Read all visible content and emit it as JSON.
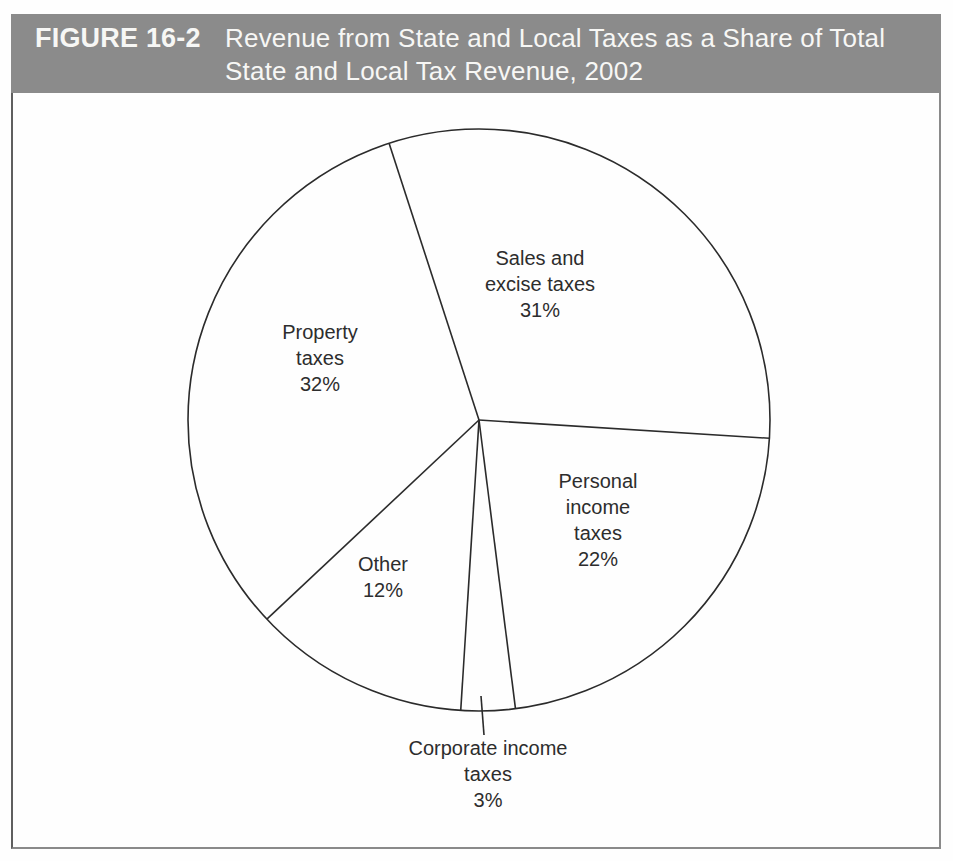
{
  "figure": {
    "tag": "FIGURE 16-2",
    "title_line1": "Revenue from State and Local Taxes as a Share of Total",
    "title_line2": "State and Local Tax Revenue, 2002"
  },
  "colors": {
    "header_bg": "#8b8b8b",
    "header_text": "#f7f7f5",
    "pie_line": "#2b2b2b",
    "background": "#fefefe"
  },
  "chart_data": {
    "type": "pie",
    "title": "Revenue from State and Local Taxes as a Share of Total State and Local Tax Revenue, 2002",
    "year": "2002",
    "units": "percent of total state and local tax revenue",
    "slices": [
      {
        "label": "Sales and excise taxes",
        "pct_label": "31%",
        "value": 31
      },
      {
        "label": "Personal income taxes",
        "pct_label": "22%",
        "value": 22
      },
      {
        "label": "Corporate income taxes",
        "pct_label": "3%",
        "value": 3
      },
      {
        "label": "Other",
        "pct_label": "12%",
        "value": 12
      },
      {
        "label": "Property taxes",
        "pct_label": "32%",
        "value": 32
      }
    ],
    "start_angle_deg": -18,
    "direction": "clockwise",
    "slice_fill": "white",
    "outline_only": true,
    "legend": "labels-inside",
    "annotation": "Corporate income taxes slice labeled outside with leader line"
  }
}
